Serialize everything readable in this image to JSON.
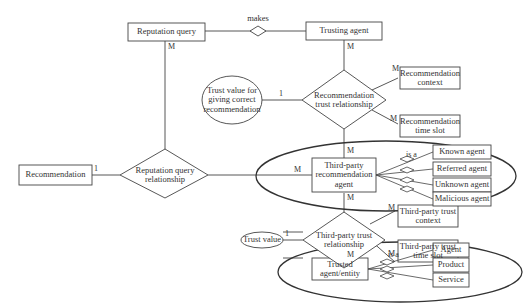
{
  "diagram": {
    "type": "entity-relationship",
    "entities": {
      "reputation_query": "Reputation query",
      "trusting_agent": "Trusting agent",
      "recommendation": "Recommendation",
      "third_party_agent": "Third-party\nrecommendation\nagent",
      "trusted_entity": "Trusted\nagent/entity",
      "recommendation_context": "Recommendation\ncontext",
      "recommendation_time_slot": "Recommendation\ntime slot",
      "third_party_trust_context": "Third-party trust\ncontext",
      "third_party_trust_time_slot": "Third-party trust\ntime slot",
      "known_agent": "Known agent",
      "referred_agent": "Referred agent",
      "unknown_agent": "Unknown agent",
      "malicious_agent": "Malicious agent",
      "agent": "Agent",
      "product": "Product",
      "service": "Service"
    },
    "relationships": {
      "makes": "makes",
      "recommendation_trust": "Recommendation\ntrust relationship",
      "reputation_query_rel": "Reputation query\nrelationship",
      "third_party_trust": "Third-party trust\nrelationship"
    },
    "attributes": {
      "trust_value_correct": "Trust value for\ngiving correct\nrecommendation",
      "trust_value": "Trust value"
    },
    "isa_labels": [
      "is a",
      "is a"
    ],
    "cardinalities": {
      "rq_down": "M",
      "ta_down": "M",
      "tv_one": "1",
      "rc_m": "M",
      "rts_m": "M",
      "tpa_up": "M",
      "tpa_left": "M",
      "rec_one": "1",
      "tpa_down": "M",
      "tv2_one": "1",
      "tptc_m": "M",
      "tpts_m": "M",
      "te_up": "M"
    }
  }
}
